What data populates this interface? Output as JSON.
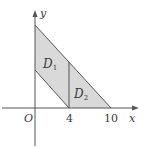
{
  "diagram": {
    "axes": {
      "x_label": "x",
      "y_label": "y",
      "origin_label": "O"
    },
    "ticks": {
      "x": [
        "4",
        "10"
      ]
    },
    "regions": [
      {
        "name": "D1",
        "label_main": "D",
        "label_sub": "1"
      },
      {
        "name": "D2",
        "label_main": "D",
        "label_sub": "2"
      }
    ],
    "colors": {
      "fill": "#d9d9d9",
      "line": "#555555",
      "axis": "#555555",
      "background": "#ffffff"
    }
  }
}
